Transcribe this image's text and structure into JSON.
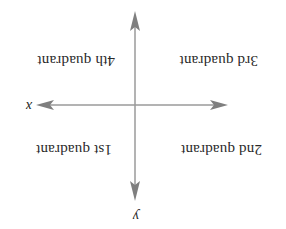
{
  "diagram": {
    "orientation": "rotated-180",
    "axes": {
      "x_label": "x",
      "y_label": "y",
      "color": "#8a8a8a"
    },
    "quadrants": {
      "first": "1st quadrant",
      "second": "2nd quadrant",
      "third": "3rd quadrant",
      "fourth": "4th quadrant"
    }
  }
}
